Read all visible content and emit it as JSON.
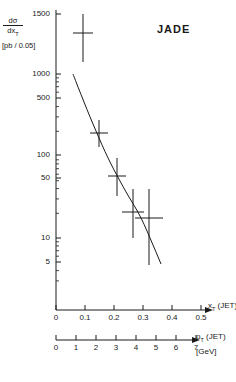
{
  "title": "JADE",
  "axes": {
    "y": {
      "label_numerator": "dσ",
      "label_denominator": "dx",
      "label_denominator_sub": "T",
      "units": "[pb / 0.05]",
      "scale": "log",
      "ticks": [
        {
          "value": 1500,
          "label": "1500",
          "px": 14
        },
        {
          "value": 1000,
          "label": "1000",
          "px": 74
        },
        {
          "value": 500,
          "label": "500",
          "px": 98
        },
        {
          "value": 100,
          "label": "100",
          "px": 155
        },
        {
          "value": 50,
          "label": "50",
          "px": 178
        },
        {
          "value": 10,
          "label": "10",
          "px": 238
        },
        {
          "value": 5,
          "label": "5",
          "px": 262
        }
      ],
      "range": [
        2.2,
        1700
      ]
    },
    "x_top": {
      "name": "x",
      "name_sub": "T",
      "name_suffix": "(JET)",
      "ticks": [
        "0",
        "0.1",
        "0.2",
        "0.3",
        "0.4",
        "0.5"
      ],
      "values": [
        0,
        0.1,
        0.2,
        0.3,
        0.4,
        0.5
      ]
    },
    "x_bottom": {
      "name": "p",
      "name_sub": "T",
      "name_suffix": "(JET)",
      "units": "[GeV]",
      "ticks": [
        "0",
        "1",
        "2",
        "3",
        "4",
        "5",
        "6",
        "7"
      ],
      "values": [
        0,
        1,
        2,
        3,
        4,
        5,
        6,
        7
      ]
    }
  },
  "chart_data": {
    "type": "scatter",
    "title": "JADE",
    "xlabel": "x_T (JET)",
    "xlabel_secondary": "p_T (JET) [GeV]",
    "ylabel": "dσ/dx_T [pb / 0.05]",
    "yscale": "log",
    "ylim": [
      2.2,
      1700
    ],
    "xlim": [
      0,
      0.52
    ],
    "grid": false,
    "legend": false,
    "points": [
      {
        "x": 0.1,
        "y": 1300,
        "yerr_low": 1300,
        "yerr_high": 200,
        "x_px": 83,
        "y_px": 33,
        "xerr_px": 10,
        "ybar_top_px": 14,
        "ybar_bot_px": 62
      },
      {
        "x": 0.197,
        "y": 190,
        "yerr_low": 60,
        "yerr_high": 55,
        "x_px": 99,
        "y_px": 133,
        "xerr_px": 9,
        "ybar_top_px": 120,
        "ybar_bot_px": 147
      },
      {
        "x": 0.253,
        "y": 57,
        "yerr_low": 22,
        "yerr_high": 20,
        "x_px": 117,
        "y_px": 176,
        "xerr_px": 9,
        "ybar_top_px": 158,
        "ybar_bot_px": 196
      },
      {
        "x": 0.305,
        "y": 18,
        "yerr_low": 9,
        "yerr_high": 12,
        "x_px": 133,
        "y_px": 212,
        "xerr_px": 11,
        "ybar_top_px": 189,
        "ybar_bot_px": 238
      },
      {
        "x": 0.355,
        "y": 15,
        "yerr_low": 11,
        "yerr_high": 14,
        "x_px": 149,
        "y_px": 218,
        "xerr_px": 14,
        "ybar_top_px": 189,
        "ybar_bot_px": 265
      }
    ],
    "curve": {
      "label": "theory curve",
      "points_px": [
        [
          73,
          74
        ],
        [
          78,
          87
        ],
        [
          84,
          102
        ],
        [
          90,
          117
        ],
        [
          96,
          131
        ],
        [
          102,
          145
        ],
        [
          108,
          158
        ],
        [
          114,
          170
        ],
        [
          120,
          181
        ],
        [
          126,
          192
        ],
        [
          132,
          202
        ],
        [
          138,
          212
        ],
        [
          144,
          224
        ],
        [
          150,
          238
        ],
        [
          156,
          252
        ],
        [
          161,
          264
        ]
      ]
    }
  },
  "geometry": {
    "y_axis_x_px": 56,
    "x_axis_top_y_px": 310,
    "x_axis_bottom_y_px": 340,
    "x0_px": 56,
    "x_per_unit_px": 290
  }
}
